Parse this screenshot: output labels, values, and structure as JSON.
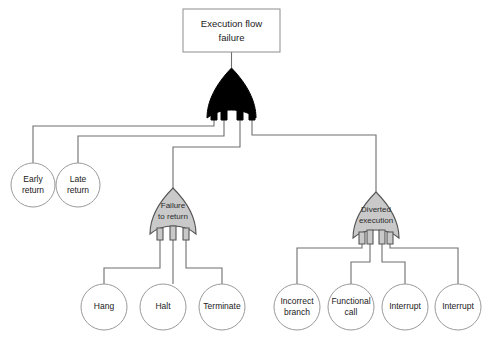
{
  "diagram": {
    "background_color": "#ffffff",
    "wire_color": "#6e6e6e",
    "gate_gray_color": "#c9c9c9",
    "gate_black_color": "#000000"
  },
  "top_event": {
    "line1": "Execution flow",
    "line2": "failure",
    "shape": "rectangle"
  },
  "gates": {
    "root": {
      "label": "",
      "type": "or-gate",
      "fill": "#000000"
    },
    "failure_to_return": {
      "line1": "Failure",
      "line2": "to return",
      "type": "or-gate",
      "fill": "#c9c9c9"
    },
    "diverted_execution": {
      "line1": "Diverted",
      "line2": "execution",
      "type": "or-gate",
      "fill": "#c9c9c9"
    }
  },
  "basic_events": {
    "root_children": [
      {
        "id": "early-return",
        "line1": "Early",
        "line2": "return"
      },
      {
        "id": "late-return",
        "line1": "Late",
        "line2": "return"
      }
    ],
    "failure_to_return_children": [
      {
        "id": "hang",
        "line1": "Hang",
        "line2": ""
      },
      {
        "id": "halt",
        "line1": "Halt",
        "line2": ""
      },
      {
        "id": "terminate",
        "line1": "Terminate",
        "line2": ""
      }
    ],
    "diverted_execution_children": [
      {
        "id": "incorrect-branch",
        "line1": "Incorrect",
        "line2": "branch"
      },
      {
        "id": "functional-call",
        "line1": "Functional",
        "line2": "call"
      },
      {
        "id": "interrupt-1",
        "line1": "Interrupt",
        "line2": ""
      },
      {
        "id": "interrupt-2",
        "line1": "Interrupt",
        "line2": ""
      }
    ]
  }
}
